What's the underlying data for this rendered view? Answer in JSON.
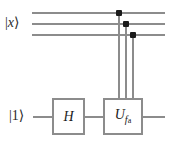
{
  "diagram": {
    "type": "quantum-circuit",
    "title": "",
    "colors": {
      "wire": "#8c8c8c",
      "gate_border": "#8c8c8c",
      "control_dot": "#1a1a1a",
      "text": "#1a1a1a",
      "background": "#ffffff"
    },
    "registers": [
      {
        "id": "x-register",
        "label_bar": "|",
        "label_symbol": "x",
        "label_ket": "⟩",
        "wire_count": 3,
        "wire_ys": [
          12,
          23,
          34
        ]
      },
      {
        "id": "ancilla-register",
        "label_bar": "|",
        "label_symbol": "1",
        "label_ket": "⟩",
        "wire_count": 1,
        "wire_ys": [
          116
        ]
      }
    ],
    "gates": [
      {
        "id": "hadamard",
        "symbol": "H",
        "subscript": "",
        "subsubscript": "",
        "x": 52,
        "y": 98,
        "width": 33,
        "height": 37
      },
      {
        "id": "oracle",
        "symbol": "U",
        "subscript": "f",
        "subsubscript": "a",
        "x": 103,
        "y": 98,
        "width": 40,
        "height": 37
      }
    ],
    "controls": [
      {
        "id": "control-wire-1",
        "wire_index": 0,
        "x": 118,
        "y": 12
      },
      {
        "id": "control-wire-2",
        "wire_index": 1,
        "x": 125,
        "y": 23
      },
      {
        "id": "control-wire-3",
        "wire_index": 2,
        "x": 132,
        "y": 34
      }
    ]
  }
}
